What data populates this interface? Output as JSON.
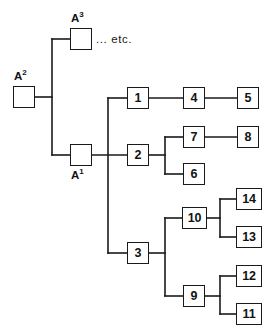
{
  "diagram": {
    "type": "tree-diagram",
    "title": "",
    "stroke_color": "#1a1a1a",
    "background_color": "#ffffff",
    "etc_text": "... etc.",
    "ancestor_labels": {
      "a1_base": "A",
      "a1_sup": "1",
      "a2_base": "A",
      "a2_sup": "2",
      "a3_base": "A",
      "a3_sup": "3"
    },
    "nodes": [
      {
        "id": "A3",
        "label": "",
        "x": 70,
        "y": 28,
        "w": 22,
        "h": 22,
        "named": true
      },
      {
        "id": "A2",
        "label": "",
        "x": 13,
        "y": 86,
        "w": 22,
        "h": 22,
        "named": true
      },
      {
        "id": "A1",
        "label": "",
        "x": 70,
        "y": 144,
        "w": 22,
        "h": 22,
        "named": true
      },
      {
        "id": "n1",
        "label": "1",
        "x": 127,
        "y": 87,
        "w": 22,
        "h": 22,
        "named": false
      },
      {
        "id": "n4",
        "label": "4",
        "x": 183,
        "y": 87,
        "w": 22,
        "h": 22,
        "named": false
      },
      {
        "id": "n5",
        "label": "5",
        "x": 237,
        "y": 87,
        "w": 22,
        "h": 22,
        "named": false
      },
      {
        "id": "n2",
        "label": "2",
        "x": 127,
        "y": 144,
        "w": 22,
        "h": 22,
        "named": false
      },
      {
        "id": "n7",
        "label": "7",
        "x": 183,
        "y": 126,
        "w": 22,
        "h": 22,
        "named": false
      },
      {
        "id": "n8",
        "label": "8",
        "x": 237,
        "y": 126,
        "w": 22,
        "h": 22,
        "named": false
      },
      {
        "id": "n6",
        "label": "6",
        "x": 183,
        "y": 163,
        "w": 22,
        "h": 22,
        "named": false
      },
      {
        "id": "n3",
        "label": "3",
        "x": 127,
        "y": 242,
        "w": 22,
        "h": 22,
        "named": false
      },
      {
        "id": "n10",
        "label": "10",
        "x": 182,
        "y": 207,
        "w": 25,
        "h": 22,
        "named": false
      },
      {
        "id": "n14",
        "label": "14",
        "x": 236,
        "y": 188,
        "w": 26,
        "h": 22,
        "named": false
      },
      {
        "id": "n13",
        "label": "13",
        "x": 236,
        "y": 226,
        "w": 26,
        "h": 22,
        "named": false
      },
      {
        "id": "n9",
        "label": "9",
        "x": 183,
        "y": 285,
        "w": 22,
        "h": 22,
        "named": false
      },
      {
        "id": "n12",
        "label": "12",
        "x": 236,
        "y": 265,
        "w": 26,
        "h": 22,
        "named": false
      },
      {
        "id": "n11",
        "label": "11",
        "x": 236,
        "y": 303,
        "w": 26,
        "h": 22,
        "named": false
      }
    ],
    "edges": [
      {
        "from": "A2",
        "to": "trunk-top",
        "desc": "A2 right stub to upper trunk"
      },
      {
        "from": "trunk-top",
        "to": "A3",
        "desc": "upper trunk to A3"
      },
      {
        "from": "trunk-top",
        "to": "A1",
        "desc": "upper trunk to A1"
      },
      {
        "from": "A1",
        "to": "trunk-main",
        "desc": "A1 right stub to main trunk"
      },
      {
        "from": "trunk-main",
        "to": "n1",
        "desc": "main trunk to node 1"
      },
      {
        "from": "trunk-main",
        "to": "n2",
        "desc": "main trunk to node 2"
      },
      {
        "from": "trunk-main",
        "to": "n3",
        "desc": "main trunk to node 3"
      },
      {
        "from": "n1",
        "to": "n4",
        "desc": "node 1 to node 4"
      },
      {
        "from": "n4",
        "to": "n5",
        "desc": "node 4 to node 5"
      },
      {
        "from": "n2",
        "to": "n7",
        "desc": "node 2 to node 7"
      },
      {
        "from": "n2",
        "to": "n6",
        "desc": "node 2 to node 6"
      },
      {
        "from": "n7",
        "to": "n8",
        "desc": "node 7 to node 8"
      },
      {
        "from": "n3",
        "to": "n10",
        "desc": "node 3 to node 10"
      },
      {
        "from": "n3",
        "to": "n9",
        "desc": "node 3 to node 9"
      },
      {
        "from": "n10",
        "to": "n14",
        "desc": "node 10 to node 14"
      },
      {
        "from": "n10",
        "to": "n13",
        "desc": "node 10 to node 13"
      },
      {
        "from": "n9",
        "to": "n12",
        "desc": "node 9 to node 12"
      },
      {
        "from": "n9",
        "to": "n11",
        "desc": "node 9 to node 11"
      }
    ]
  }
}
